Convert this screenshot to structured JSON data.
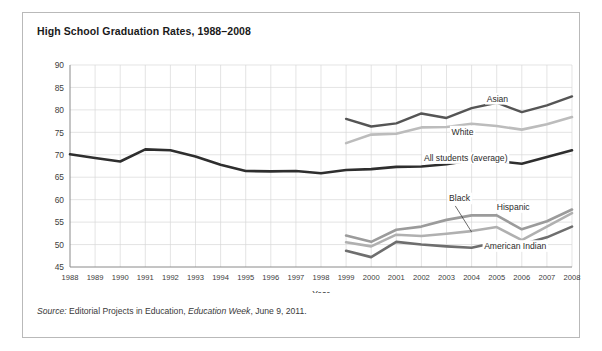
{
  "figure": {
    "title": "High School Graduation Rates, 1988–2008",
    "source_prefix": "Source:",
    "source_text_a": " Editorial Projects in Education, ",
    "source_italic": "Education Week",
    "source_text_b": ", June 9, 2011."
  },
  "chart_data": {
    "type": "line",
    "title": "High School Graduation Rates, 1988–2008",
    "xlabel": "Year",
    "ylabel": "",
    "xlim": [
      1988,
      2008
    ],
    "ylim": [
      45,
      90
    ],
    "ytick_step": 5,
    "grid": true,
    "legend": "inline-labels",
    "x": [
      1988,
      1989,
      1990,
      1991,
      1992,
      1993,
      1994,
      1995,
      1996,
      1997,
      1998,
      1999,
      2000,
      2001,
      2002,
      2003,
      2004,
      2005,
      2006,
      2007,
      2008
    ],
    "ytick_labels": [
      "45",
      "50",
      "55",
      "60",
      "65",
      "70",
      "75",
      "80",
      "85",
      "90"
    ],
    "xtick_labels": [
      "1988",
      "1989",
      "1990",
      "1991",
      "1992",
      "1993",
      "1994",
      "1995",
      "1996",
      "1997",
      "1998",
      "1999",
      "2000",
      "2001",
      "2002",
      "2003",
      "2004",
      "2005",
      "2006",
      "2007",
      "2008"
    ],
    "series": [
      {
        "name": "All students (average)",
        "color": "#2e2e2e",
        "width": 2.6,
        "label_x": 2002.1,
        "label_y": 68.6,
        "x": [
          1988,
          1989,
          1990,
          1991,
          1992,
          1993,
          1994,
          1995,
          1996,
          1997,
          1998,
          1999,
          2000,
          2001,
          2002,
          2003,
          2004,
          2005,
          2006,
          2007,
          2008
        ],
        "values": [
          70.1,
          69.3,
          68.5,
          71.2,
          71.0,
          69.6,
          67.8,
          66.4,
          66.3,
          66.4,
          65.9,
          66.6,
          66.8,
          67.3,
          67.4,
          67.9,
          68.8,
          68.6,
          68.0,
          69.5,
          71.0
        ]
      },
      {
        "name": "Asian",
        "color": "#555555",
        "width": 2.4,
        "label_x": 2004.6,
        "label_y": 81.8,
        "x": [
          1999,
          2000,
          2001,
          2002,
          2003,
          2004,
          2005,
          2006,
          2007,
          2008
        ],
        "values": [
          78.0,
          76.3,
          77.0,
          79.2,
          78.2,
          80.4,
          81.6,
          79.5,
          81.0,
          83.0
        ]
      },
      {
        "name": "White",
        "color": "#bcbcbc",
        "width": 2.6,
        "label_x": 2003.2,
        "label_y": 74.5,
        "x": [
          1999,
          2000,
          2001,
          2002,
          2003,
          2004,
          2005,
          2006,
          2007,
          2008
        ],
        "values": [
          72.6,
          74.5,
          74.7,
          76.1,
          76.2,
          76.9,
          76.4,
          75.6,
          76.8,
          78.4
        ]
      },
      {
        "name": "Hispanic",
        "color": "#9b9b9b",
        "width": 2.6,
        "label_x": 2005.0,
        "label_y": 57.7,
        "x": [
          1999,
          2000,
          2001,
          2002,
          2003,
          2004,
          2005,
          2006,
          2007,
          2008
        ],
        "values": [
          52.0,
          50.6,
          53.3,
          54.0,
          55.5,
          56.5,
          56.5,
          53.4,
          55.2,
          57.8
        ]
      },
      {
        "name": "Black",
        "color": "#b0b0b0",
        "width": 2.6,
        "label_x": 2003.1,
        "label_y": 59.6,
        "leader": {
          "x1": 2003.35,
          "y1": 58.6,
          "x2": 2004.0,
          "y2": 52.8
        },
        "x": [
          1999,
          2000,
          2001,
          2002,
          2003,
          2004,
          2005,
          2006,
          2007,
          2008
        ],
        "values": [
          50.5,
          49.6,
          52.2,
          51.9,
          52.4,
          53.0,
          53.9,
          51.0,
          54.0,
          57.0
        ]
      },
      {
        "name": "American Indian",
        "color": "#6e6e6e",
        "width": 2.6,
        "label_x": 2004.5,
        "label_y": 49.0,
        "x": [
          1999,
          2000,
          2001,
          2002,
          2003,
          2004,
          2005,
          2006,
          2007,
          2008
        ],
        "values": [
          48.6,
          47.2,
          50.6,
          50.0,
          49.6,
          49.3,
          50.5,
          50.0,
          51.6,
          54.0
        ]
      }
    ]
  }
}
